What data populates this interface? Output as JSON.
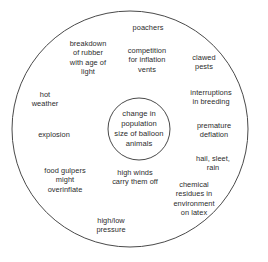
{
  "diagram": {
    "title": "change in population size of balloon animals",
    "type": "concentric-circle-cause-diagram",
    "stroke_color": "#4a4a4a",
    "text_color": "#2b2b2b",
    "background_color": "#ffffff",
    "outer_circle": {
      "cx": 130,
      "cy": 129,
      "r": 118
    },
    "inner_circle": {
      "cx": 139,
      "cy": 129,
      "r": 31
    },
    "center": {
      "text": "change in\npopulation\nsize of balloon\nanimals",
      "x": 139,
      "y": 129
    },
    "causes": [
      {
        "id": "poachers",
        "text": "poachers",
        "x": 148,
        "y": 28
      },
      {
        "id": "breakdown-of-rubber",
        "text": "breakdown\nof rubber\nwith age of\nlight",
        "x": 88,
        "y": 58
      },
      {
        "id": "competition-for-vents",
        "text": "competition\nfor inflation\nvents",
        "x": 147,
        "y": 60
      },
      {
        "id": "clawed-pests",
        "text": "clawed\npests",
        "x": 204,
        "y": 62
      },
      {
        "id": "hot-weather",
        "text": "hot\nweather",
        "x": 45,
        "y": 99
      },
      {
        "id": "interruptions-breeding",
        "text": "interruptions\nin breeding",
        "x": 211,
        "y": 97
      },
      {
        "id": "explosion",
        "text": "explosion",
        "x": 54,
        "y": 135
      },
      {
        "id": "premature-deflation",
        "text": "premature\ndeflation",
        "x": 214,
        "y": 130
      },
      {
        "id": "hail-sleet-rain",
        "text": "hail, sleet,\nrain",
        "x": 213,
        "y": 163
      },
      {
        "id": "food-gulpers",
        "text": "food gulpers\nmight\noverinflate",
        "x": 65,
        "y": 180
      },
      {
        "id": "high-winds",
        "text": "high winds\ncarry them off",
        "x": 135,
        "y": 177
      },
      {
        "id": "chemical-residues",
        "text": "chemical\nresidues in\nenvironment\non latex",
        "x": 194,
        "y": 199
      },
      {
        "id": "high-low-pressure",
        "text": "high/low\npressure",
        "x": 111,
        "y": 225
      }
    ]
  }
}
